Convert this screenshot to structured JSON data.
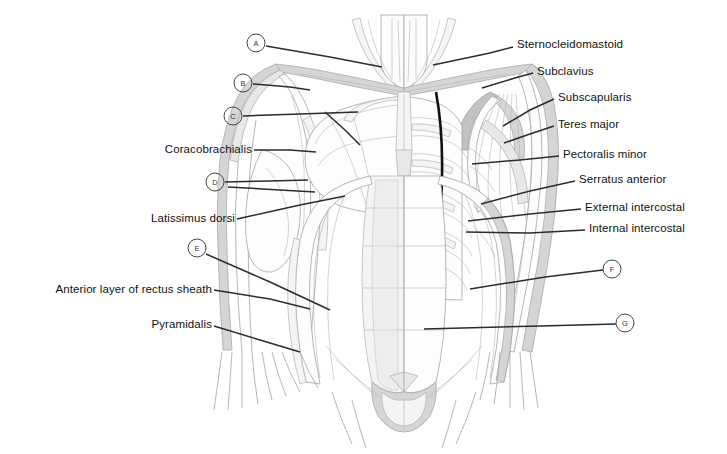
{
  "figure": {
    "background_color": "#ffffff",
    "ink_color": "#111111",
    "leader_color": "#2b2b2b",
    "outline_color": "#9a9a9a",
    "shade_light": "#f2f2f2",
    "shade_mid": "#d9d9d9",
    "shade_dark": "#bdbdbd",
    "highlight_black": "#111111"
  },
  "labels": {
    "right": [
      {
        "id": "sternocleidomastoid",
        "text": "Sternocleidomastoid",
        "x": 517,
        "y": 45,
        "leader": [
          [
            513,
            47
          ],
          [
            490,
            53
          ],
          [
            433,
            65
          ]
        ]
      },
      {
        "id": "subclavius",
        "text": "Subclavius",
        "x": 537,
        "y": 72,
        "leader": [
          [
            533,
            73
          ],
          [
            515,
            78
          ],
          [
            482,
            88
          ]
        ]
      },
      {
        "id": "subscapularis",
        "text": "Subscapularis",
        "x": 558,
        "y": 98,
        "leader": [
          [
            554,
            99
          ],
          [
            530,
            110
          ],
          [
            503,
            126
          ]
        ]
      },
      {
        "id": "teres-major",
        "text": "Teres major",
        "x": 558,
        "y": 125,
        "leader": [
          [
            554,
            126
          ],
          [
            530,
            134
          ],
          [
            504,
            143
          ]
        ]
      },
      {
        "id": "pectoralis-minor",
        "text": "Pectoralis minor",
        "x": 563,
        "y": 155,
        "leader": [
          [
            559,
            156
          ],
          [
            520,
            160
          ],
          [
            472,
            164
          ]
        ]
      },
      {
        "id": "serratus-anterior",
        "text": "Serratus anterior",
        "x": 579,
        "y": 180,
        "leader": [
          [
            575,
            181
          ],
          [
            530,
            191
          ],
          [
            481,
            204
          ]
        ]
      },
      {
        "id": "external-intercostal",
        "text": "External intercostal",
        "x": 585,
        "y": 208,
        "leader": [
          [
            581,
            209
          ],
          [
            530,
            214
          ],
          [
            468,
            221
          ]
        ]
      },
      {
        "id": "internal-intercostal",
        "text": "Internal intercostal",
        "x": 589,
        "y": 229,
        "leader": [
          [
            585,
            230
          ],
          [
            530,
            233
          ],
          [
            466,
            232
          ]
        ]
      }
    ],
    "left": [
      {
        "id": "coracobrachialis",
        "text": "Coracobrachialis",
        "x": 252,
        "y": 150,
        "leader": [
          [
            254,
            150
          ],
          [
            290,
            150
          ],
          [
            316,
            152
          ]
        ]
      },
      {
        "id": "latissimus-dorsi",
        "text": "Latissimus dorsi",
        "x": 235,
        "y": 219,
        "leader": [
          [
            237,
            219
          ],
          [
            300,
            205
          ],
          [
            345,
            196
          ]
        ]
      },
      {
        "id": "anterior-rectus-sheath",
        "text": "Anterior layer of rectus sheath",
        "x": 212,
        "y": 290,
        "leader": [
          [
            214,
            290
          ],
          [
            270,
            299
          ],
          [
            310,
            309
          ]
        ]
      },
      {
        "id": "pyramidalis",
        "text": "Pyramidalis",
        "x": 212,
        "y": 325,
        "leader": [
          [
            214,
            326
          ],
          [
            260,
            340
          ],
          [
            300,
            352
          ]
        ]
      }
    ]
  },
  "letters": [
    {
      "id": "A",
      "text": "A",
      "x": 256,
      "y": 43,
      "leader": [
        [
          266,
          46
        ],
        [
          330,
          57
        ],
        [
          382,
          67
        ]
      ]
    },
    {
      "id": "B",
      "text": "B",
      "x": 243,
      "y": 83,
      "leader": [
        [
          253,
          84
        ],
        [
          290,
          87
        ],
        [
          310,
          90
        ]
      ]
    },
    {
      "id": "C",
      "text": "C",
      "x": 233,
      "y": 116,
      "leader": [
        [
          243,
          116
        ],
        [
          300,
          114
        ],
        [
          358,
          112
        ]
      ]
    },
    {
      "id": "C2",
      "text": "",
      "x": 0,
      "y": 0,
      "leader": [
        [
          325,
          112
        ],
        [
          345,
          130
        ],
        [
          360,
          145
        ]
      ]
    },
    {
      "id": "D",
      "text": "D",
      "x": 215,
      "y": 182,
      "leader": [
        [
          225,
          182
        ],
        [
          270,
          181
        ],
        [
          308,
          180
        ]
      ]
    },
    {
      "id": "D2",
      "text": "",
      "x": 0,
      "y": 0,
      "leader": [
        [
          228,
          187
        ],
        [
          280,
          190
        ],
        [
          315,
          192
        ]
      ]
    },
    {
      "id": "E",
      "text": "E",
      "x": 197,
      "y": 248,
      "leader": [
        [
          206,
          254
        ],
        [
          270,
          282
        ],
        [
          330,
          310
        ]
      ]
    },
    {
      "id": "F",
      "text": "F",
      "x": 612,
      "y": 269,
      "leader": [
        [
          603,
          270
        ],
        [
          545,
          277
        ],
        [
          470,
          289
        ]
      ]
    },
    {
      "id": "G",
      "text": "G",
      "x": 625,
      "y": 323,
      "leader": [
        [
          616,
          324
        ],
        [
          540,
          326
        ],
        [
          424,
          329
        ]
      ]
    }
  ],
  "anatomy_regions": [
    {
      "id": "neck",
      "label": "neck and sternocleidomastoid"
    },
    {
      "id": "clavicle-left",
      "label": "left clavicle band"
    },
    {
      "id": "clavicle-right",
      "label": "right clavicle band"
    },
    {
      "id": "pectoralis-major-left",
      "label": "left pectoralis major"
    },
    {
      "id": "rib-cage-right",
      "label": "right rib cage with intercostals"
    },
    {
      "id": "rectus-abdominis",
      "label": "rectus abdominis with tendinous intersections"
    },
    {
      "id": "external-oblique-left",
      "label": "left external oblique"
    },
    {
      "id": "serratus-right",
      "label": "right serratus anterior digitations"
    },
    {
      "id": "inguinal-region",
      "label": "inguinal region and pyramidalis"
    }
  ]
}
